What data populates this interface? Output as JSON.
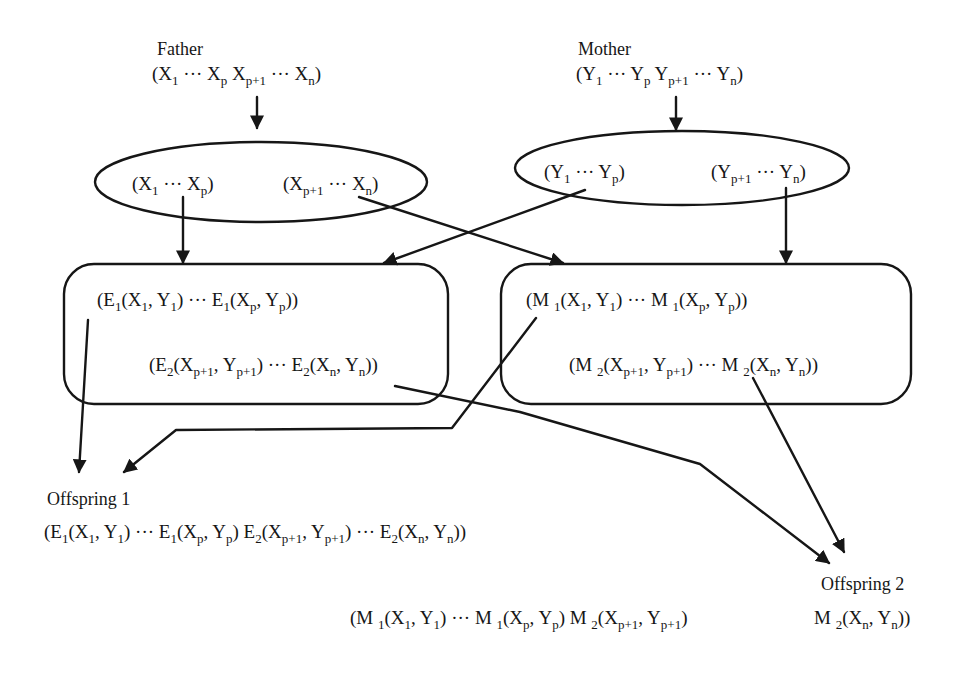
{
  "diagram": {
    "title": "",
    "colors": {
      "stroke": "#161616",
      "background": "#ffffff",
      "text": "#161616"
    },
    "parents": {
      "father": {
        "label": "Father",
        "chromosome": [
          {
            "t": "(X"
          },
          {
            "s": "1"
          },
          {
            "t": " ··· X"
          },
          {
            "s": "p"
          },
          {
            "t": " X"
          },
          {
            "s": "p+1"
          },
          {
            "t": " ··· X"
          },
          {
            "s": "n"
          },
          {
            "t": ")"
          }
        ]
      },
      "mother": {
        "label": "Mother",
        "chromosome": [
          {
            "t": "(Y"
          },
          {
            "s": "1"
          },
          {
            "t": " ··· Y"
          },
          {
            "s": "p"
          },
          {
            "t": " Y"
          },
          {
            "s": "p+1"
          },
          {
            "t": " ··· Y"
          },
          {
            "s": "n"
          },
          {
            "t": ")"
          }
        ]
      }
    },
    "split_ellipses": {
      "father": {
        "left": [
          {
            "t": "(X"
          },
          {
            "s": "1"
          },
          {
            "t": " ··· X"
          },
          {
            "s": "p"
          },
          {
            "t": ")"
          }
        ],
        "right": [
          {
            "t": "(X"
          },
          {
            "s": "p+1"
          },
          {
            "t": " ··· X"
          },
          {
            "s": "n"
          },
          {
            "t": ")"
          }
        ]
      },
      "mother": {
        "left": [
          {
            "t": "(Y"
          },
          {
            "s": "1"
          },
          {
            "t": " ··· Y"
          },
          {
            "s": "p"
          },
          {
            "t": ")"
          }
        ],
        "right": [
          {
            "t": "(Y"
          },
          {
            "s": "p+1"
          },
          {
            "t": " ··· Y"
          },
          {
            "s": "n"
          },
          {
            "t": ")"
          }
        ]
      }
    },
    "operator_boxes": {
      "E": {
        "line1": [
          {
            "t": "(E"
          },
          {
            "s": "1"
          },
          {
            "t": "(X"
          },
          {
            "s": "1"
          },
          {
            "t": ", Y"
          },
          {
            "s": "1"
          },
          {
            "t": ") ··· E"
          },
          {
            "s": "1"
          },
          {
            "t": "(X"
          },
          {
            "s": "p"
          },
          {
            "t": ", Y"
          },
          {
            "s": "p"
          },
          {
            "t": "))"
          }
        ],
        "line2": [
          {
            "t": "(E"
          },
          {
            "s": "2"
          },
          {
            "t": "(X"
          },
          {
            "s": "p+1"
          },
          {
            "t": ", Y"
          },
          {
            "s": "p+1"
          },
          {
            "t": ") ···  E"
          },
          {
            "s": "2"
          },
          {
            "t": "(X"
          },
          {
            "s": "n"
          },
          {
            "t": ", Y"
          },
          {
            "s": "n"
          },
          {
            "t": "))"
          }
        ]
      },
      "M": {
        "line1": [
          {
            "t": "(M "
          },
          {
            "s": "1"
          },
          {
            "t": "(X"
          },
          {
            "s": "1"
          },
          {
            "t": ", Y"
          },
          {
            "s": "1"
          },
          {
            "t": ") ··· M "
          },
          {
            "s": "1"
          },
          {
            "t": "(X"
          },
          {
            "s": "p"
          },
          {
            "t": ", Y"
          },
          {
            "s": "p"
          },
          {
            "t": "))"
          }
        ],
        "line2": [
          {
            "t": "(M "
          },
          {
            "s": "2"
          },
          {
            "t": "(X"
          },
          {
            "s": "p+1"
          },
          {
            "t": ", Y"
          },
          {
            "s": "p+1"
          },
          {
            "t": ") ··· M "
          },
          {
            "s": "2"
          },
          {
            "t": "(X"
          },
          {
            "s": "n"
          },
          {
            "t": ", Y"
          },
          {
            "s": "n"
          },
          {
            "t": "))"
          }
        ]
      }
    },
    "offspring": {
      "one": {
        "label": "Offspring 1",
        "chromosome": [
          {
            "t": "(E"
          },
          {
            "s": "1"
          },
          {
            "t": "(X"
          },
          {
            "s": "1"
          },
          {
            "t": ", Y"
          },
          {
            "s": "1"
          },
          {
            "t": ") ··· E"
          },
          {
            "s": "1"
          },
          {
            "t": "(X"
          },
          {
            "s": "p"
          },
          {
            "t": ", Y"
          },
          {
            "s": "p"
          },
          {
            "t": ") E"
          },
          {
            "s": "2"
          },
          {
            "t": "(X"
          },
          {
            "s": "p+1"
          },
          {
            "t": ", Y"
          },
          {
            "s": "p+1"
          },
          {
            "t": ") ··· E"
          },
          {
            "s": "2"
          },
          {
            "t": "(X"
          },
          {
            "s": "n"
          },
          {
            "t": ", Y"
          },
          {
            "s": "n"
          },
          {
            "t": "))"
          }
        ]
      },
      "two": {
        "label": "Offspring 2",
        "chromosome_part1": [
          {
            "t": "(M "
          },
          {
            "s": "1"
          },
          {
            "t": "(X"
          },
          {
            "s": "1"
          },
          {
            "t": ", Y"
          },
          {
            "s": "1"
          },
          {
            "t": ") ··· M "
          },
          {
            "s": "1"
          },
          {
            "t": "(X"
          },
          {
            "s": "p"
          },
          {
            "t": ", Y"
          },
          {
            "s": "p"
          },
          {
            "t": ") M "
          },
          {
            "s": "2"
          },
          {
            "t": "(X"
          },
          {
            "s": "p+1"
          },
          {
            "t": ", Y"
          },
          {
            "s": "p+1"
          },
          {
            "t": ")"
          }
        ],
        "chromosome_part2": [
          {
            "t": "M "
          },
          {
            "s": "2"
          },
          {
            "t": "(X"
          },
          {
            "s": "n"
          },
          {
            "t": ", Y"
          },
          {
            "s": "n"
          },
          {
            "t": "))"
          }
        ]
      }
    }
  }
}
